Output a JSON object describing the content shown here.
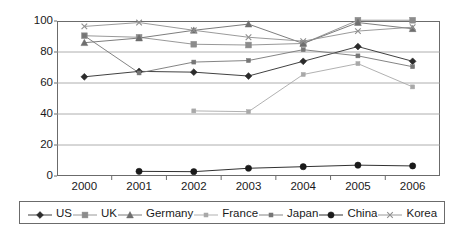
{
  "chart_data": {
    "type": "line",
    "title": "",
    "subtitle": "",
    "xlabel": "",
    "ylabel": "",
    "categories": [
      "2000",
      "2001",
      "2002",
      "2003",
      "2004",
      "2005",
      "2006"
    ],
    "ylim": [
      0,
      100
    ],
    "yticks": [
      0,
      20,
      40,
      60,
      80,
      100
    ],
    "ytick_labels": [
      "0",
      "20",
      "40",
      "60",
      "80",
      "100"
    ],
    "grid": "horizontal",
    "legend_position": "bottom",
    "series": [
      {
        "name": "US",
        "marker": "filled-diamond",
        "color": "#2b2b2b",
        "values": [
          64,
          67.5,
          67,
          64.5,
          74,
          83.5,
          74
        ]
      },
      {
        "name": "UK",
        "marker": "filled-square",
        "color": "#8c8c8c",
        "values": [
          90.5,
          89.5,
          85,
          84.5,
          85.5,
          100.5,
          100.5
        ]
      },
      {
        "name": "Germany",
        "marker": "filled-triangle",
        "color": "#6e6e6e",
        "values": [
          86,
          89,
          94,
          98,
          85.5,
          99,
          95
        ]
      },
      {
        "name": "France",
        "marker": "small-square",
        "color": "#a8a8a8",
        "values": [
          null,
          null,
          42,
          41.5,
          65.5,
          72.5,
          57.5
        ]
      },
      {
        "name": "Japan",
        "marker": "small-square",
        "color": "#767676",
        "values": [
          90.5,
          66.5,
          73.5,
          74.5,
          81.5,
          77.5,
          70.5
        ]
      },
      {
        "name": "China",
        "marker": "filled-circle",
        "color": "#1a1a1a",
        "values": [
          null,
          3,
          2.8,
          5,
          6,
          7,
          6.5
        ]
      },
      {
        "name": "Korea",
        "marker": "cross",
        "color": "#8f8f8f",
        "values": [
          96.5,
          99,
          94,
          89.5,
          87,
          93.5,
          96
        ]
      }
    ]
  },
  "legend": {
    "items": [
      {
        "label": "US"
      },
      {
        "label": "UK"
      },
      {
        "label": "Germany"
      },
      {
        "label": "France"
      },
      {
        "label": "Japan"
      },
      {
        "label": "China"
      },
      {
        "label": "Korea"
      }
    ]
  },
  "colors": {
    "frame": "#6b6b6b",
    "grid": "#9a9a9a",
    "background": "#ffffff",
    "text": "#1a1a1a"
  }
}
